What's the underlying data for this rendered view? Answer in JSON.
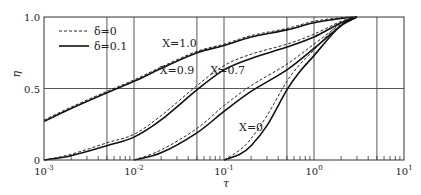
{
  "chart_data": {
    "type": "line",
    "title": "",
    "xlabel": "τ",
    "ylabel": "η",
    "xscale": "log",
    "xlim": [
      0.001,
      10
    ],
    "ylim": [
      0,
      1.0
    ],
    "grid": true,
    "x_ticks": [
      {
        "value": 0.001,
        "label": "10",
        "exp": "-3"
      },
      {
        "value": 0.01,
        "label": "10",
        "exp": "-2"
      },
      {
        "value": 0.1,
        "label": "10",
        "exp": "-1"
      },
      {
        "value": 1,
        "label": "10",
        "exp": "0"
      },
      {
        "value": 10,
        "label": "10",
        "exp": "1"
      }
    ],
    "x_gridlines": [
      0.005,
      0.01,
      0.05,
      0.1,
      0.5,
      1,
      5
    ],
    "y_ticks": [
      {
        "value": 0,
        "label": "0"
      },
      {
        "value": 0.5,
        "label": "0.5"
      },
      {
        "value": 1.0,
        "label": "1.0"
      }
    ],
    "legend": {
      "position": "upper-left",
      "entries": [
        {
          "label": "δ=0",
          "style": "dashed"
        },
        {
          "label": "δ=0.1",
          "style": "solid"
        }
      ]
    },
    "series": [
      {
        "name": "X=1.0, δ=0.1",
        "style": "solid",
        "x": [
          0.001,
          0.002,
          0.005,
          0.01,
          0.02,
          0.05,
          0.1,
          0.2,
          0.5,
          1,
          2,
          3
        ],
        "y": [
          0.27,
          0.36,
          0.47,
          0.55,
          0.64,
          0.75,
          0.8,
          0.86,
          0.91,
          0.96,
          0.99,
          1.0
        ]
      },
      {
        "name": "X=1.0, δ=0",
        "style": "dashed",
        "x": [
          0.001,
          0.002,
          0.005,
          0.01,
          0.02,
          0.05,
          0.1,
          0.2,
          0.5,
          1,
          2,
          3
        ],
        "y": [
          0.28,
          0.37,
          0.48,
          0.56,
          0.65,
          0.76,
          0.81,
          0.87,
          0.92,
          0.97,
          0.995,
          1.0
        ]
      },
      {
        "name": "X=0.9, δ=0.1",
        "style": "solid",
        "x": [
          0.001,
          0.002,
          0.005,
          0.01,
          0.02,
          0.05,
          0.1,
          0.2,
          0.5,
          1,
          2,
          3
        ],
        "y": [
          0.0,
          0.03,
          0.1,
          0.16,
          0.28,
          0.49,
          0.63,
          0.71,
          0.79,
          0.86,
          0.96,
          1.0
        ]
      },
      {
        "name": "X=0.9, δ=0",
        "style": "dashed",
        "x": [
          0.001,
          0.002,
          0.005,
          0.01,
          0.02,
          0.05,
          0.1,
          0.2,
          0.5,
          1,
          2,
          3
        ],
        "y": [
          0.0,
          0.04,
          0.12,
          0.18,
          0.31,
          0.52,
          0.66,
          0.74,
          0.81,
          0.88,
          0.97,
          1.0
        ]
      },
      {
        "name": "X=0.7, δ=0.1",
        "style": "solid",
        "x": [
          0.01,
          0.02,
          0.05,
          0.1,
          0.2,
          0.5,
          1,
          2,
          3
        ],
        "y": [
          0.0,
          0.05,
          0.19,
          0.34,
          0.48,
          0.63,
          0.78,
          0.94,
          1.0
        ]
      },
      {
        "name": "X=0.7, δ=0",
        "style": "dashed",
        "x": [
          0.01,
          0.02,
          0.05,
          0.1,
          0.2,
          0.5,
          1,
          2,
          3
        ],
        "y": [
          0.0,
          0.07,
          0.22,
          0.38,
          0.52,
          0.67,
          0.81,
          0.95,
          1.0
        ]
      },
      {
        "name": "X=0, δ=0.1",
        "style": "solid",
        "x": [
          0.1,
          0.15,
          0.2,
          0.3,
          0.5,
          0.7,
          1,
          1.5,
          2,
          3
        ],
        "y": [
          0.0,
          0.04,
          0.1,
          0.24,
          0.49,
          0.62,
          0.73,
          0.86,
          0.94,
          1.0
        ]
      },
      {
        "name": "X=0, δ=0",
        "style": "dashed",
        "x": [
          0.1,
          0.15,
          0.2,
          0.3,
          0.5,
          0.7,
          1,
          1.5,
          2,
          3
        ],
        "y": [
          0.0,
          0.07,
          0.15,
          0.31,
          0.55,
          0.67,
          0.77,
          0.89,
          0.96,
          1.0
        ]
      }
    ],
    "annotations": [
      {
        "text": "X=1.0",
        "x": 0.032,
        "y": 0.79
      },
      {
        "text": "X=0.9",
        "x": 0.03,
        "y": 0.6
      },
      {
        "text": "X=0.7",
        "x": 0.11,
        "y": 0.6
      },
      {
        "text": "X=0",
        "x": 0.2,
        "y": 0.2
      }
    ]
  },
  "layout": {
    "plot_left": 44,
    "plot_right": 404,
    "plot_top": 17,
    "plot_bottom": 160
  }
}
